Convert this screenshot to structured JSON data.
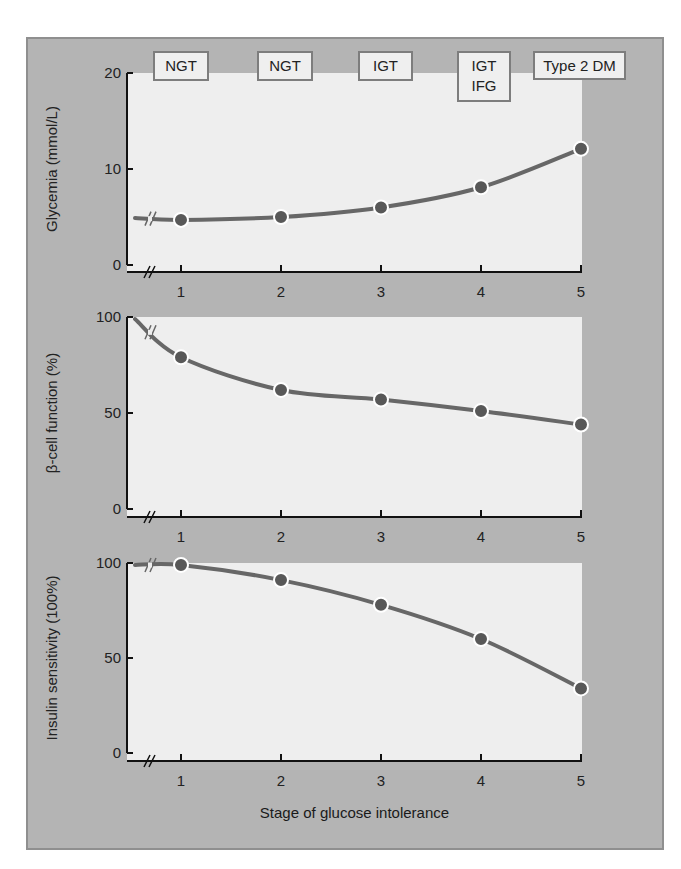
{
  "figure": {
    "x_axis_title": "Stage of glucose intolerance",
    "stage_labels": [
      {
        "lines": [
          "NGT"
        ],
        "stage": 1
      },
      {
        "lines": [
          "NGT"
        ],
        "stage": 2
      },
      {
        "lines": [
          "IGT"
        ],
        "stage": 3
      },
      {
        "lines": [
          "IGT",
          "IFG"
        ],
        "stage": 4
      },
      {
        "lines": [
          "Type 2 DM"
        ],
        "stage": 5
      }
    ],
    "colors": {
      "panel_bg": "#b4b4b4",
      "plot_bg": "#eeeeee",
      "line": "#676767",
      "marker": "#585858",
      "marker_outline": "#ffffff",
      "axis": "#111111"
    }
  },
  "chart_data": [
    {
      "type": "line",
      "title": "",
      "xlabel": "Stage of glucose intolerance",
      "ylabel": "Glycemia (mmol/L)",
      "categories": [
        "1",
        "2",
        "3",
        "4",
        "5"
      ],
      "x": [
        1,
        2,
        3,
        4,
        5
      ],
      "values": [
        4.7,
        5.0,
        6.0,
        8.1,
        12.1
      ],
      "yticks": [
        0,
        10,
        20
      ],
      "ylim": [
        0,
        20
      ],
      "axis_break": true,
      "lead_in_value": 4.9,
      "grid": false,
      "legend": "none"
    },
    {
      "type": "line",
      "title": "",
      "xlabel": "Stage of glucose intolerance",
      "ylabel": "β-cell function (%)",
      "categories": [
        "1",
        "2",
        "3",
        "4",
        "5"
      ],
      "x": [
        1,
        2,
        3,
        4,
        5
      ],
      "values": [
        79,
        62,
        57,
        51,
        44
      ],
      "yticks": [
        0,
        50,
        100
      ],
      "ylim": [
        0,
        100
      ],
      "axis_break": true,
      "lead_in_value": 100,
      "grid": false,
      "legend": "none"
    },
    {
      "type": "line",
      "title": "",
      "xlabel": "Stage of glucose intolerance",
      "ylabel": "Insulin sensitivity (100%)",
      "categories": [
        "1",
        "2",
        "3",
        "4",
        "5"
      ],
      "x": [
        1,
        2,
        3,
        4,
        5
      ],
      "values": [
        99,
        91,
        78,
        60,
        34
      ],
      "yticks": [
        0,
        50,
        100
      ],
      "ylim": [
        0,
        100
      ],
      "axis_break": true,
      "lead_in_value": 100,
      "grid": false,
      "legend": "none"
    }
  ]
}
